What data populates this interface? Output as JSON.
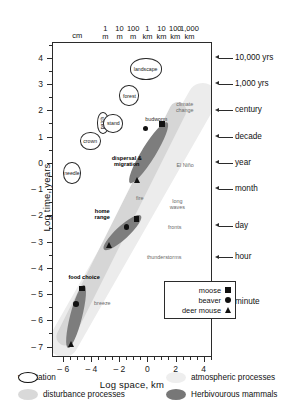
{
  "chart_data": {
    "type": "scatter",
    "title": "",
    "xlabel": "Log space, km",
    "ylabel": "Log time, years",
    "xlim": [
      -6.8,
      4.6
    ],
    "ylim": [
      -7.4,
      4.6
    ],
    "xticks": [
      -6,
      -4,
      -2,
      0,
      2,
      4
    ],
    "xtick_labels": [
      "– 6",
      "– 4",
      "– 2",
      "0",
      "2",
      "4"
    ],
    "yticks": [
      4,
      3,
      2,
      1,
      0,
      -1,
      -2,
      -3,
      -4,
      -5,
      -6,
      -7
    ],
    "ytick_labels": [
      "4",
      "3",
      "2",
      "1",
      "0",
      "– 1",
      "– 2",
      "– 3",
      "– 4",
      "– 5",
      "– 6",
      "– 7"
    ],
    "grid": false,
    "top_scale": {
      "labels": [
        {
          "text": "cm",
          "x": -5.0
        },
        {
          "text": "1\nm",
          "x": -3.0
        },
        {
          "text": "10\nm",
          "x": -2.0
        },
        {
          "text": "100\nm",
          "x": -1.0
        },
        {
          "text": "1\nkm",
          "x": 0.0
        },
        {
          "text": "10\nkm",
          "x": 1.0
        },
        {
          "text": "100\nkm",
          "x": 2.0
        },
        {
          "text": "1,000\nkm",
          "x": 3.0
        }
      ]
    },
    "right_time_axis": [
      {
        "label": "10,000 yrs",
        "y": 4.0
      },
      {
        "label": "1,000 yrs",
        "y": 3.0
      },
      {
        "label": "century",
        "y": 2.0
      },
      {
        "label": "decade",
        "y": 1.0
      },
      {
        "label": "year",
        "y": 0.0
      },
      {
        "label": "month",
        "y": -1.0
      },
      {
        "label": "day",
        "y": -2.4
      },
      {
        "label": "hour",
        "y": -3.6
      },
      {
        "label": "minute",
        "y": -5.3
      }
    ],
    "vegetation_bubbles": [
      {
        "label": "needle",
        "x": -5.45,
        "y": -0.35,
        "w": 18,
        "h": 22,
        "rotated": false
      },
      {
        "label": "crown",
        "x": -4.15,
        "y": 0.85,
        "w": 21,
        "h": 18,
        "rotated": false
      },
      {
        "label": "patch",
        "x": -3.25,
        "y": 1.55,
        "w": 12,
        "h": 22,
        "rotated": true
      },
      {
        "label": "stand",
        "x": -2.5,
        "y": 1.55,
        "w": 20,
        "h": 19,
        "rotated": false
      },
      {
        "label": "forest",
        "x": -1.35,
        "y": 2.6,
        "w": 20,
        "h": 21,
        "rotated": false
      },
      {
        "label": "landscape",
        "x": -0.2,
        "y": 3.6,
        "w": 32,
        "h": 22,
        "rotated": false
      }
    ],
    "process_labels": [
      {
        "label": "budworm",
        "x": 0.55,
        "y": 1.72,
        "style": "plain"
      },
      {
        "label": "climate change",
        "x": 2.6,
        "y": 2.15,
        "style": "light",
        "lines": [
          "climate",
          "change"
        ]
      },
      {
        "label": "El Niño",
        "x": 2.6,
        "y": -0.05,
        "style": "light"
      },
      {
        "label": "dispersal & migration",
        "x": -1.55,
        "y": 0.1,
        "style": "bold",
        "lines": [
          "dispersal &",
          "migration"
        ]
      },
      {
        "label": "fire",
        "x": -0.6,
        "y": -1.3,
        "style": "light"
      },
      {
        "label": "home range",
        "x": -3.3,
        "y": -1.9,
        "style": "bold",
        "lines": [
          "home",
          "range"
        ]
      },
      {
        "label": "long waves",
        "x": 2.05,
        "y": -1.55,
        "style": "light",
        "lines": [
          "long",
          "waves"
        ]
      },
      {
        "label": "fronts",
        "x": 1.85,
        "y": -2.4,
        "style": "light"
      },
      {
        "label": "thunderstorms",
        "x": 1.1,
        "y": -3.55,
        "style": "light"
      },
      {
        "label": "food choice",
        "x": -4.6,
        "y": -4.3,
        "style": "bold"
      },
      {
        "label": "breeze",
        "x": -3.3,
        "y": -5.3,
        "style": "light"
      }
    ],
    "clusters": [
      {
        "name": "budworm",
        "points": [
          {
            "species": "beaver",
            "marker": "circle",
            "x": -0.2,
            "y": 1.35
          },
          {
            "species": "moose",
            "marker": "square",
            "x": 0.95,
            "y": 1.52
          }
        ]
      },
      {
        "name": "dispersal & migration",
        "points": [
          {
            "species": "deer mouse",
            "marker": "triangle",
            "x": -0.85,
            "y": -0.6
          }
        ]
      },
      {
        "name": "home range",
        "points": [
          {
            "species": "moose",
            "marker": "square",
            "x": -0.85,
            "y": -2.1
          },
          {
            "species": "beaver",
            "marker": "circle",
            "x": -1.55,
            "y": -2.4
          },
          {
            "species": "deer mouse",
            "marker": "triangle",
            "x": -2.85,
            "y": -3.1
          }
        ]
      },
      {
        "name": "food choice",
        "points": [
          {
            "species": "moose",
            "marker": "square",
            "x": -4.75,
            "y": -4.75
          },
          {
            "species": "beaver",
            "marker": "circle",
            "x": -5.15,
            "y": -5.35
          },
          {
            "species": "deer mouse",
            "marker": "triangle",
            "x": -5.55,
            "y": -6.85
          }
        ]
      }
    ],
    "species_legend": {
      "items": [
        {
          "label": "moose",
          "marker": "square"
        },
        {
          "label": "beaver",
          "marker": "circle"
        },
        {
          "label": "deer mouse",
          "marker": "triangle"
        }
      ]
    },
    "category_legend": {
      "items": [
        {
          "label": "vegetation",
          "swatch": "veg",
          "color": "#ffffff"
        },
        {
          "label": "atmospheric processes",
          "swatch": "atmos",
          "color": "#eeeeee"
        },
        {
          "label": "disturbance processes",
          "swatch": "dist",
          "color": "#d9d9d9"
        },
        {
          "label": "Herbivourous mammals",
          "swatch": "herb",
          "color": "#777777"
        }
      ]
    }
  }
}
